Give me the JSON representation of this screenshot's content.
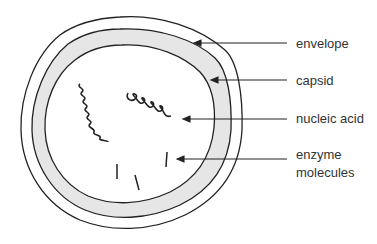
{
  "diagram": {
    "labels": [
      {
        "id": "envelope",
        "text": "envelope"
      },
      {
        "id": "capsid",
        "text": "capsid"
      },
      {
        "id": "nucleic_acid",
        "text": "nucleic acid"
      },
      {
        "id": "enzyme_molecules",
        "line1": "enzyme",
        "line2": "molecules"
      }
    ],
    "colors": {
      "stroke": "#222222",
      "capsid_fill": "#e6e6e6",
      "text": "#333333"
    }
  }
}
